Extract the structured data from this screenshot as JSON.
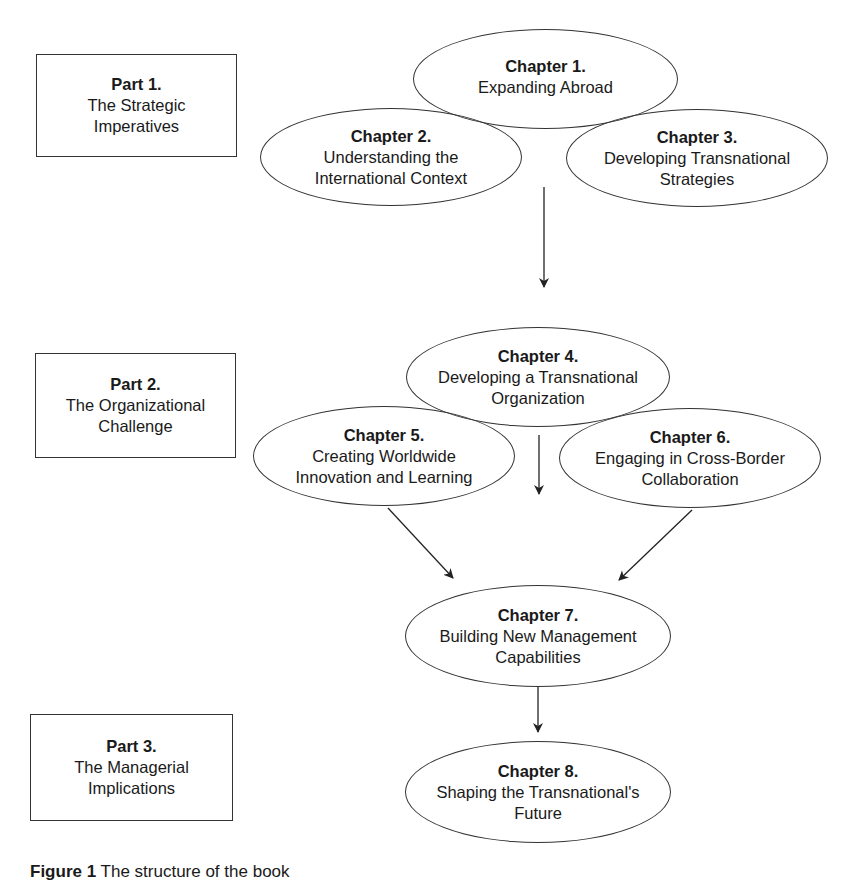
{
  "parts": [
    {
      "title": "Part 1.",
      "subtitle": "The Strategic\nImperatives"
    },
    {
      "title": "Part 2.",
      "subtitle": "The Organizational\nChallenge"
    },
    {
      "title": "Part 3.",
      "subtitle": "The Managerial\nImplications"
    }
  ],
  "chapters": [
    {
      "title": "Chapter 1.",
      "subtitle": "Expanding Abroad"
    },
    {
      "title": "Chapter 2.",
      "subtitle": "Understanding the\nInternational Context"
    },
    {
      "title": "Chapter 3.",
      "subtitle": "Developing Transnational\nStrategies"
    },
    {
      "title": "Chapter 4.",
      "subtitle": "Developing a Transnational\nOrganization"
    },
    {
      "title": "Chapter 5.",
      "subtitle": "Creating Worldwide\nInnovation and Learning"
    },
    {
      "title": "Chapter 6.",
      "subtitle": "Engaging in Cross-Border\nCollaboration"
    },
    {
      "title": "Chapter 7.",
      "subtitle": "Building New Management\nCapabilities"
    },
    {
      "title": "Chapter 8.",
      "subtitle": "Shaping the Transnational's\nFuture"
    }
  ],
  "edges": [
    {
      "from": "Part 1 group",
      "to": "Chapter 4"
    },
    {
      "from": "Chapter 4",
      "to": "Chapter 7"
    },
    {
      "from": "Chapter 5",
      "to": "Chapter 7"
    },
    {
      "from": "Chapter 6",
      "to": "Chapter 7"
    },
    {
      "from": "Chapter 7",
      "to": "Chapter 8"
    }
  ],
  "caption": {
    "label": "Figure 1",
    "text": "The structure of the book"
  }
}
